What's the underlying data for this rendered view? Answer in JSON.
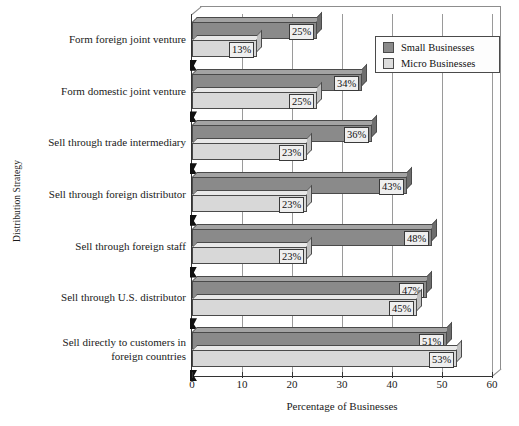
{
  "chart_data": {
    "type": "bar",
    "orientation": "horizontal",
    "title": "",
    "xlabel": "Percentage of Businesses",
    "ylabel": "Distribution Strategy",
    "xlim": [
      0,
      60
    ],
    "xticks": [
      0,
      10,
      20,
      30,
      40,
      50,
      60
    ],
    "grid": true,
    "legend_position": "top-right",
    "categories": [
      "Form foreign joint venture",
      "Form domestic joint venture",
      "Sell through trade intermediary",
      "Sell through foreign distributor",
      "Sell through foreign staff",
      "Sell through U.S. distributor",
      "Sell directly to customers in foreign countries"
    ],
    "series": [
      {
        "name": "Small Businesses",
        "color": "#8a8a8a",
        "values": [
          25,
          34,
          36,
          43,
          48,
          47,
          51
        ],
        "value_labels": [
          "25%",
          "34%",
          "36%",
          "43%",
          "48%",
          "47%",
          "51%"
        ]
      },
      {
        "name": "Micro Businesses",
        "color": "#d8d8d8",
        "values": [
          13,
          25,
          23,
          23,
          23,
          45,
          53
        ],
        "value_labels": [
          "13%",
          "25%",
          "23%",
          "23%",
          "23%",
          "45%",
          "53%"
        ]
      }
    ]
  },
  "axis": {
    "x_title": "Percentage of Businesses",
    "y_title": "Distribution Strategy",
    "tick_labels": [
      "0",
      "10",
      "20",
      "30",
      "40",
      "50",
      "60"
    ]
  },
  "legend": {
    "items": [
      {
        "label": "Small Businesses"
      },
      {
        "label": "Micro Businesses"
      }
    ]
  },
  "category_labels": [
    {
      "line1": "Form foreign joint venture",
      "line2": ""
    },
    {
      "line1": "Form domestic joint venture",
      "line2": ""
    },
    {
      "line1": "Sell through trade intermediary",
      "line2": ""
    },
    {
      "line1": "Sell through foreign distributor",
      "line2": ""
    },
    {
      "line1": "Sell through foreign staff",
      "line2": ""
    },
    {
      "line1": "Sell through U.S. distributor",
      "line2": ""
    },
    {
      "line1": "Sell directly to customers in",
      "line2": "foreign countries"
    }
  ]
}
